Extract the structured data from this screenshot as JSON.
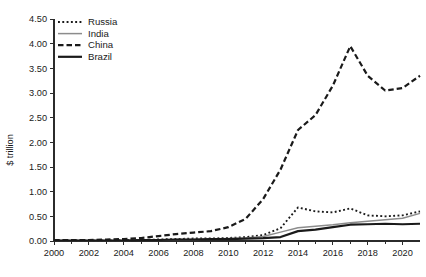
{
  "chart_data": {
    "type": "line",
    "title": "",
    "subtitle": "",
    "xlabel": "",
    "ylabel": "$ trillion",
    "xlim": [
      2000,
      2021
    ],
    "ylim": [
      0.0,
      4.5
    ],
    "grid": false,
    "legend_position": "top-left",
    "x": [
      2000,
      2001,
      2002,
      2003,
      2004,
      2005,
      2006,
      2007,
      2008,
      2009,
      2010,
      2011,
      2012,
      2013,
      2014,
      2015,
      2016,
      2017,
      2018,
      2019,
      2020,
      2021
    ],
    "x_tick_labels": [
      "2000",
      "2002",
      "2004",
      "2006",
      "2008",
      "2010",
      "2012",
      "2014",
      "2016",
      "2018",
      "2020"
    ],
    "x_tick_values": [
      2000,
      2002,
      2004,
      2006,
      2008,
      2010,
      2012,
      2014,
      2016,
      2018,
      2020
    ],
    "y_tick_labels": [
      "0.00",
      "0.50",
      "1.00",
      "1.50",
      "2.00",
      "2.50",
      "3.00",
      "3.50",
      "4.00",
      "4.50"
    ],
    "y_tick_values": [
      0.0,
      0.5,
      1.0,
      1.5,
      2.0,
      2.5,
      3.0,
      3.5,
      4.0,
      4.5
    ],
    "series": [
      {
        "name": "Russia",
        "style": "dotted",
        "color": "#1a1a1a",
        "width": 1.9,
        "values": [
          0.01,
          0.01,
          0.01,
          0.01,
          0.02,
          0.02,
          0.03,
          0.04,
          0.05,
          0.05,
          0.06,
          0.08,
          0.12,
          0.26,
          0.68,
          0.6,
          0.58,
          0.66,
          0.52,
          0.5,
          0.52,
          0.6
        ]
      },
      {
        "name": "India",
        "style": "solid",
        "color": "#8c8c8c",
        "width": 1.5,
        "values": [
          0.01,
          0.01,
          0.01,
          0.01,
          0.01,
          0.02,
          0.02,
          0.03,
          0.03,
          0.04,
          0.05,
          0.06,
          0.09,
          0.18,
          0.27,
          0.3,
          0.33,
          0.37,
          0.4,
          0.43,
          0.46,
          0.56
        ]
      },
      {
        "name": "China",
        "style": "dashed",
        "color": "#1a1a1a",
        "width": 2.2,
        "values": [
          0.02,
          0.02,
          0.02,
          0.03,
          0.04,
          0.06,
          0.1,
          0.14,
          0.17,
          0.2,
          0.28,
          0.45,
          0.85,
          1.45,
          2.25,
          2.55,
          3.15,
          3.95,
          3.35,
          3.05,
          3.1,
          3.35
        ]
      },
      {
        "name": "Brazil",
        "style": "solid",
        "color": "#1a1a1a",
        "width": 2.2,
        "values": [
          0.01,
          0.01,
          0.01,
          0.01,
          0.01,
          0.02,
          0.02,
          0.03,
          0.03,
          0.04,
          0.04,
          0.05,
          0.06,
          0.08,
          0.2,
          0.23,
          0.28,
          0.33,
          0.34,
          0.35,
          0.34,
          0.35
        ]
      }
    ]
  },
  "legend": {
    "items": [
      {
        "label": "Russia"
      },
      {
        "label": "India"
      },
      {
        "label": "China"
      },
      {
        "label": "Brazil"
      }
    ]
  }
}
